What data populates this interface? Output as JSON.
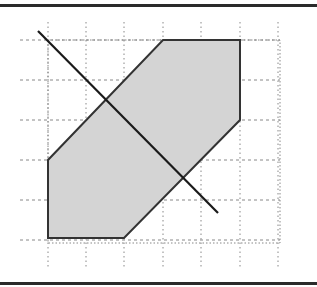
{
  "figure": {
    "colors": {
      "region_fill": "#d4d4d4",
      "region_stroke": "#333333",
      "line": "#1a1a1a",
      "grid": "#888888",
      "rule": "#2a2a2a"
    },
    "grid": {
      "x": [
        48,
        86,
        124,
        163,
        201,
        240,
        278
      ],
      "y": [
        40,
        80,
        120,
        160,
        200,
        240
      ],
      "frame": {
        "x0": 48,
        "y0": 40,
        "x1": 280,
        "y1": 243
      }
    },
    "region_points": "48,160 48,238 124,238 240,120 240,40 163,40",
    "line": {
      "x1": 38,
      "y1": 31,
      "x2": 218,
      "y2": 213
    }
  }
}
